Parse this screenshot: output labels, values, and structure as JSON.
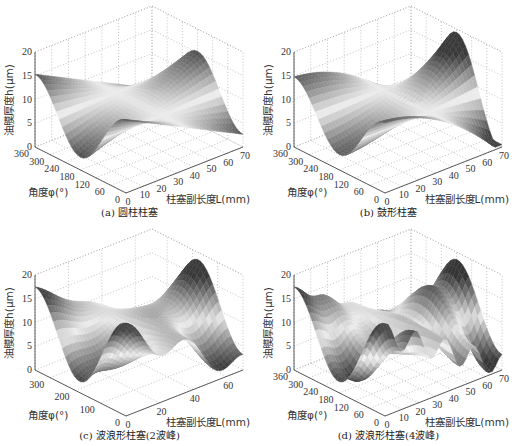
{
  "chart_data": [
    {
      "type": "surface",
      "panel": "a",
      "title": "(a) 圆柱柱塞",
      "xlabel": "柱塞副长度L(mm)",
      "ylabel": "角度φ(°)",
      "zlabel": "油膜厚度h(μm)",
      "x_ticks": [
        0,
        10,
        20,
        30,
        40,
        50,
        60,
        70
      ],
      "y_ticks": [
        0,
        60,
        120,
        180,
        240,
        300,
        360
      ],
      "z_ticks": [
        0,
        5,
        10,
        15,
        20
      ],
      "xlim": [
        0,
        70
      ],
      "ylim": [
        0,
        360
      ],
      "zlim": [
        0,
        20
      ],
      "grid": true,
      "surface": {
        "base": 9,
        "tilt": 5.5,
        "wave_amp": 0,
        "wave_count": 0,
        "crown": 0
      }
    },
    {
      "type": "surface",
      "panel": "b",
      "title": "(b) 鼓形柱塞",
      "xlabel": "柱塞副长度L(mm)",
      "ylabel": "角度φ(°)",
      "zlabel": "油膜厚度h(μm)",
      "x_ticks": [
        0,
        10,
        20,
        30,
        40,
        50,
        60,
        70
      ],
      "y_ticks": [
        0,
        60,
        120,
        180,
        240,
        300,
        360
      ],
      "z_ticks": [
        0,
        5,
        10,
        15,
        20
      ],
      "xlim": [
        0,
        70
      ],
      "ylim": [
        0,
        360
      ],
      "zlim": [
        0,
        20
      ],
      "grid": true,
      "surface": {
        "base": 9,
        "tilt": 7,
        "wave_amp": 0,
        "wave_count": 0,
        "crown": 3.5
      }
    },
    {
      "type": "surface",
      "panel": "c",
      "title": "(c) 波浪形柱塞(2波峰)",
      "xlabel": "柱塞副长度L(mm)",
      "ylabel": "角度φ(°)",
      "zlabel": "油膜厚度h(μm)",
      "x_ticks": [
        0,
        20,
        40,
        60
      ],
      "y_ticks": [
        0,
        100,
        200,
        300
      ],
      "z_ticks": [
        0,
        5,
        10,
        15,
        20
      ],
      "xlim": [
        0,
        70
      ],
      "ylim": [
        0,
        360
      ],
      "zlim": [
        0,
        20
      ],
      "grid": true,
      "surface": {
        "base": 9,
        "tilt": 7,
        "wave_amp": 2.5,
        "wave_count": 2,
        "crown": 0
      }
    },
    {
      "type": "surface",
      "panel": "d",
      "title": "(d) 波浪形柱塞(4波峰)",
      "xlabel": "柱塞副长度L(mm)",
      "ylabel": "角度φ(°)",
      "zlabel": "油膜厚度h(μm)",
      "x_ticks": [
        0,
        10,
        20,
        30,
        40,
        50,
        60,
        70
      ],
      "y_ticks": [
        0,
        60,
        120,
        180,
        240,
        300,
        360
      ],
      "z_ticks": [
        0,
        5,
        10,
        15,
        20
      ],
      "xlim": [
        0,
        70
      ],
      "ylim": [
        0,
        360
      ],
      "zlim": [
        0,
        20
      ],
      "grid": true,
      "surface": {
        "base": 9,
        "tilt": 7,
        "wave_amp": 2.5,
        "wave_count": 4,
        "crown": 0
      }
    }
  ]
}
